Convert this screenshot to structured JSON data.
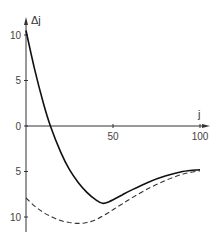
{
  "chart_data": {
    "type": "line",
    "title": "",
    "xlabel": "j",
    "ylabel": "Δj",
    "xlim": [
      0,
      100
    ],
    "ylim": [
      -10,
      10
    ],
    "grid": false,
    "legend": null,
    "x_ticks": [
      {
        "value": 0,
        "label": "0"
      },
      {
        "value": 50,
        "label": "50"
      },
      {
        "value": 100,
        "label": "100"
      }
    ],
    "y_ticks": [
      {
        "value": 10,
        "label": "10"
      },
      {
        "value": 5,
        "label": "5"
      },
      {
        "value": 0,
        "label": "0"
      },
      {
        "value": -5,
        "label": "5"
      },
      {
        "value": -10,
        "label": "10"
      }
    ],
    "series": [
      {
        "name": "solid",
        "style": "solid",
        "x": [
          0,
          5,
          10,
          14,
          20,
          25,
          30,
          35,
          40,
          44,
          48,
          55,
          60,
          70,
          80,
          90,
          100
        ],
        "y": [
          10.5,
          6.2,
          2.5,
          0,
          -2.9,
          -4.8,
          -6.2,
          -7.3,
          -8.1,
          -8.5,
          -8.3,
          -7.6,
          -7.1,
          -6.2,
          -5.5,
          -5.0,
          -4.8
        ]
      },
      {
        "name": "dashed",
        "style": "dashed",
        "x": [
          0,
          5,
          10,
          15,
          20,
          25,
          30,
          35,
          40,
          45,
          50,
          55,
          60,
          70,
          80,
          90,
          100
        ],
        "y": [
          -7.9,
          -8.8,
          -9.5,
          -10.0,
          -10.4,
          -10.6,
          -10.7,
          -10.6,
          -10.3,
          -9.8,
          -9.2,
          -8.6,
          -8.0,
          -6.9,
          -6.0,
          -5.3,
          -4.9
        ]
      }
    ]
  }
}
